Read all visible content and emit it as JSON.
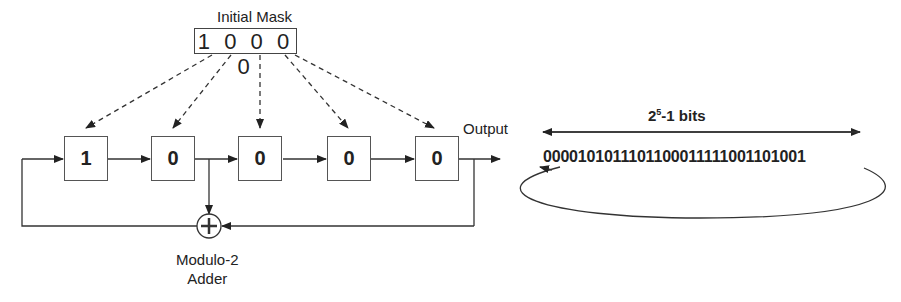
{
  "mask": {
    "title": "Initial Mask",
    "value": "1 0 0 0 0"
  },
  "registers": [
    {
      "value": "1",
      "left": 64
    },
    {
      "value": "0",
      "left": 151
    },
    {
      "value": "0",
      "left": 238
    },
    {
      "value": "0",
      "left": 327
    },
    {
      "value": "0",
      "left": 415
    }
  ],
  "output_label": "Output",
  "bits": {
    "title_base": "2",
    "title_exp": "5",
    "title_rest": "-1 bits",
    "sequence": "0000101011101100011111001101001"
  },
  "adder": {
    "line1": "Modulo-2",
    "line2": "Adder"
  }
}
